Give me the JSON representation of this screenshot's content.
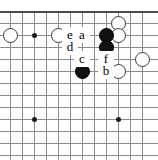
{
  "figure": {
    "kind": "go-board-diagram",
    "width": 158,
    "height": 160,
    "board_edges": [
      "top"
    ],
    "colors": {
      "grid": "#8a8a8a",
      "edge": "#4a4a4a",
      "black_stone": "#111111",
      "white_stone": "#ffffff",
      "white_stone_outline": "#3a3a3a",
      "label_text": "#000000",
      "background": "#ffffff"
    }
  },
  "grid": {
    "columns_x": [
      10,
      22,
      34,
      46,
      58,
      70,
      82,
      94,
      106,
      118,
      130,
      142
    ],
    "rows_y": [
      11,
      23,
      35,
      47,
      59,
      71,
      83,
      95,
      107,
      119,
      131,
      143,
      155
    ],
    "spacing": 12
  },
  "star_points": [
    {
      "x": 34,
      "y": 35
    },
    {
      "x": 106,
      "y": 47
    },
    {
      "x": 34,
      "y": 119
    },
    {
      "x": 118,
      "y": 119
    }
  ],
  "stones": [
    {
      "color": "white",
      "x": 10,
      "y": 35
    },
    {
      "color": "white",
      "x": 58,
      "y": 35
    },
    {
      "color": "white",
      "x": 118,
      "y": 23
    },
    {
      "color": "white",
      "x": 118,
      "y": 35
    },
    {
      "color": "white",
      "x": 142,
      "y": 59
    },
    {
      "color": "white",
      "x": 118,
      "y": 71
    },
    {
      "color": "black",
      "x": 106,
      "y": 35
    },
    {
      "color": "black",
      "x": 106,
      "y": 47
    },
    {
      "color": "black",
      "x": 82,
      "y": 71
    }
  ],
  "labels": [
    {
      "text": "e",
      "x": 70,
      "y": 35
    },
    {
      "text": "a",
      "x": 82,
      "y": 35
    },
    {
      "text": "d",
      "x": 70,
      "y": 47
    },
    {
      "text": "c",
      "x": 82,
      "y": 59
    },
    {
      "text": "f",
      "x": 106,
      "y": 59
    },
    {
      "text": "b",
      "x": 106,
      "y": 71
    }
  ]
}
